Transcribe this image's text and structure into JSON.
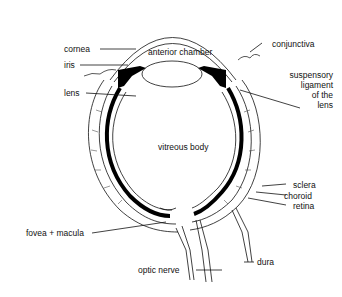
{
  "diagram": {
    "labels": {
      "cornea": "cornea",
      "iris": "iris",
      "lens": "lens",
      "anterior_chamber": "anterior chamber",
      "conjunctiva": "conjunctiva",
      "suspensory_1": "suspensory",
      "suspensory_2": "ligament",
      "suspensory_3": "of the",
      "suspensory_4": "lens",
      "vitreous_body": "vitreous body",
      "sclera": "sclera",
      "choroid": "choroid",
      "retina": "retina",
      "fovea_macula": "fovea + macula",
      "optic_nerve": "optic nerve",
      "dura": "dura"
    },
    "colors": {
      "ink": "#111111",
      "background": "#ffffff"
    }
  }
}
